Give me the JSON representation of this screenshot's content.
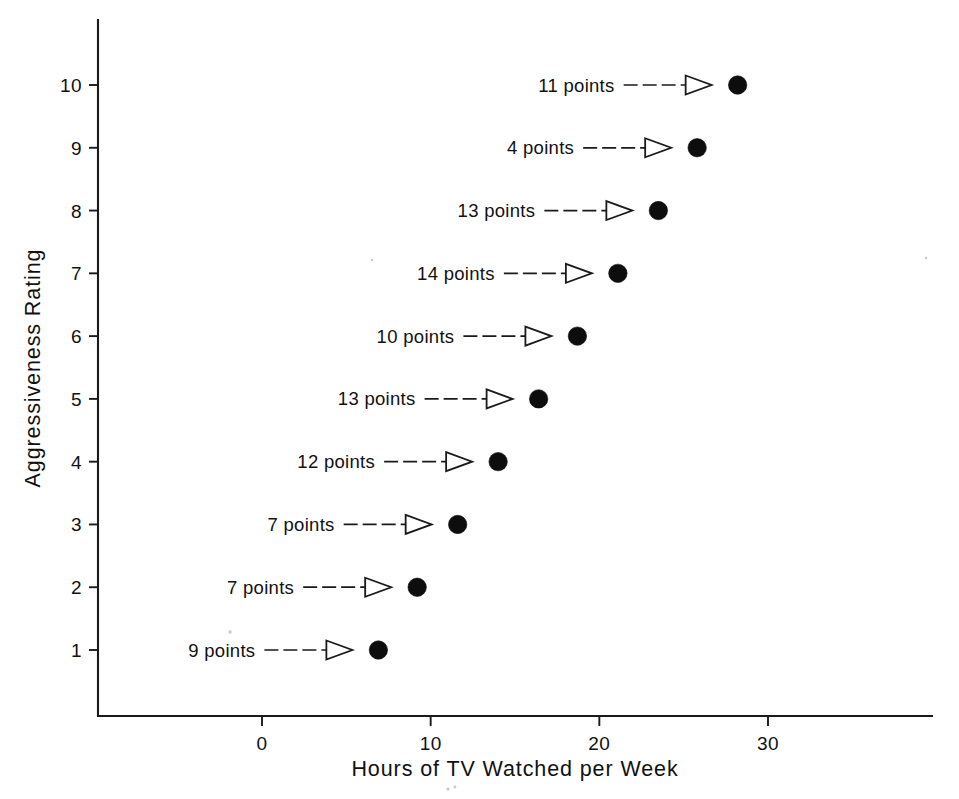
{
  "chart_data": {
    "type": "scatter",
    "title": "",
    "xlabel": "Hours of TV Watched per Week",
    "ylabel": "Aggressiveness Rating",
    "xlim": [
      -4.5,
      39.5
    ],
    "ylim": [
      0.3,
      11.4
    ],
    "grid": false,
    "legend": null,
    "xticks": [
      0,
      10,
      20,
      30
    ],
    "xticklabels": [
      "0",
      "10",
      "20",
      "30"
    ],
    "yticks": [
      1,
      2,
      3,
      4,
      5,
      6,
      7,
      8,
      9,
      10
    ],
    "yticklabels": [
      "1",
      "2",
      "3",
      "4",
      "5",
      "6",
      "7",
      "8",
      "9",
      "10"
    ],
    "x": [
      6.9,
      9.2,
      11.6,
      14.0,
      16.4,
      18.7,
      21.1,
      23.5,
      25.8,
      28.2
    ],
    "y": [
      1,
      2,
      3,
      4,
      5,
      6,
      7,
      8,
      9,
      10
    ],
    "points": [
      {
        "rating": 1,
        "hours": 6.9,
        "annotation": "9 points"
      },
      {
        "rating": 2,
        "hours": 9.2,
        "annotation": "7 points"
      },
      {
        "rating": 3,
        "hours": 11.6,
        "annotation": "7 points"
      },
      {
        "rating": 4,
        "hours": 14.0,
        "annotation": "12 points"
      },
      {
        "rating": 5,
        "hours": 16.4,
        "annotation": "13 points"
      },
      {
        "rating": 6,
        "hours": 18.7,
        "annotation": "10 points"
      },
      {
        "rating": 7,
        "hours": 21.1,
        "annotation": "14 points"
      },
      {
        "rating": 8,
        "hours": 23.5,
        "annotation": "13 points"
      },
      {
        "rating": 9,
        "hours": 25.8,
        "annotation": "4 points"
      },
      {
        "rating": 10,
        "hours": 28.2,
        "annotation": "11 points"
      }
    ],
    "annotations": [
      "9 points",
      "7 points",
      "7 points",
      "12 points",
      "13 points",
      "10 points",
      "14 points",
      "13 points",
      "4 points",
      "11 points"
    ],
    "marker": "filled-circle",
    "marker_color": "#0d0d0d",
    "annotation_arrow": "open-triangle-arrow"
  },
  "axes": {
    "x_title": "Hours of TV Watched per Week",
    "y_title": "Aggressiveness Rating"
  },
  "ticks": {
    "x": [
      {
        "label": "0",
        "value": 0
      },
      {
        "label": "10",
        "value": 10
      },
      {
        "label": "20",
        "value": 20
      },
      {
        "label": "30",
        "value": 30
      }
    ],
    "y": [
      {
        "label": "10",
        "value": 10
      },
      {
        "label": "9",
        "value": 9
      },
      {
        "label": "8",
        "value": 8
      },
      {
        "label": "7",
        "value": 7
      },
      {
        "label": "6",
        "value": 6
      },
      {
        "label": "5",
        "value": 5
      },
      {
        "label": "4",
        "value": 4
      },
      {
        "label": "3",
        "value": 3
      },
      {
        "label": "2",
        "value": 2
      },
      {
        "label": "1",
        "value": 1
      }
    ]
  },
  "colors": {
    "marker": "#0d0d0d",
    "axis": "#1a1a1a",
    "text": "#111111",
    "background": "#ffffff"
  }
}
